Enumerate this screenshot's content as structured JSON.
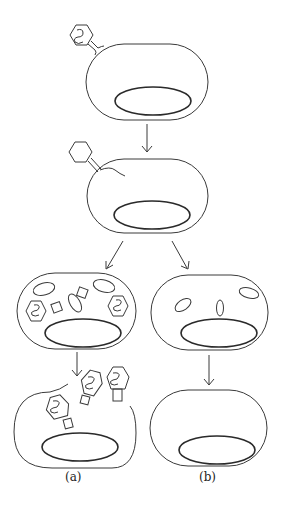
{
  "figure": {
    "stroke_color": "#3a3a3a",
    "background": "#ffffff"
  },
  "stages": [
    {
      "id": "attachment",
      "position": "top"
    },
    {
      "id": "dna-injection",
      "position": "second"
    },
    {
      "id": "lytic-replication",
      "branch": "a"
    },
    {
      "id": "lysogenic-integration",
      "branch": "b"
    },
    {
      "id": "lysis-release",
      "branch": "a"
    },
    {
      "id": "lysogen-cell",
      "branch": "b"
    }
  ],
  "labels": {
    "a": "(a)",
    "b": "(b)"
  }
}
